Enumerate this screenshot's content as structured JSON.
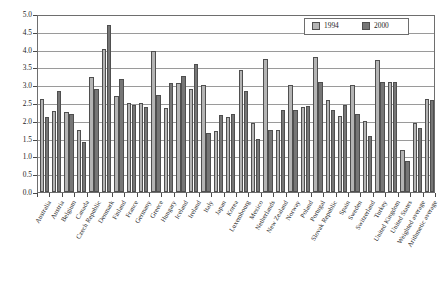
{
  "chart_data": {
    "type": "bar",
    "title": "",
    "xlabel": "",
    "ylabel": "Per cent of GDP",
    "ylim": [
      0.0,
      5.0
    ],
    "ytick_step": 0.5,
    "grid": true,
    "legend_position": "top-right",
    "ytick_labels": [
      "0.0",
      "0.5",
      "1.0",
      "1.5",
      "2.0",
      "2.5",
      "3.0",
      "3.5",
      "4.0",
      "4.5",
      "5.0"
    ],
    "categories": [
      "Australia",
      "Austria",
      "Belgium",
      "Canada",
      "Czech Republic",
      "Denmark",
      "Finland",
      "France",
      "Germany",
      "Greece",
      "Hungary",
      "Iceland",
      "Ireland",
      "Italy",
      "Japan",
      "Korea",
      "Luxembourg",
      "Mexico",
      "Netherlands",
      "New Zealand",
      "Norway",
      "Poland",
      "Portugal",
      "Slovak Republic",
      "Spain",
      "Sweden",
      "Switzerland",
      "Turkey",
      "United Kingdom",
      "United States",
      "Weighted average",
      "Arithmetic average"
    ],
    "series": [
      {
        "name": "1994",
        "color": "#b4b4b4",
        "values": [
          2.6,
          2.28,
          2.25,
          1.74,
          3.24,
          4.03,
          2.7,
          2.49,
          2.49,
          3.97,
          2.35,
          3.06,
          2.9,
          3.02,
          1.7,
          2.1,
          3.42,
          1.95,
          3.73,
          1.73,
          3.02,
          2.4,
          3.78,
          2.58,
          2.14,
          3.02,
          2.0,
          3.72,
          3.1,
          1.18,
          1.95,
          2.62
        ]
      },
      {
        "name": "2000",
        "color": "#767676",
        "values": [
          2.1,
          2.84,
          2.18,
          1.4,
          2.89,
          4.68,
          3.18,
          2.44,
          2.4,
          2.72,
          3.07,
          3.27,
          3.6,
          1.65,
          2.15,
          2.2,
          2.85,
          1.48,
          1.75,
          2.3,
          2.3,
          2.42,
          3.08,
          2.3,
          2.45,
          2.18,
          1.58,
          3.1,
          3.08,
          0.88,
          1.8,
          2.58
        ]
      }
    ]
  },
  "legend": {
    "entries": [
      {
        "label": "1994"
      },
      {
        "label": "2000"
      }
    ]
  }
}
